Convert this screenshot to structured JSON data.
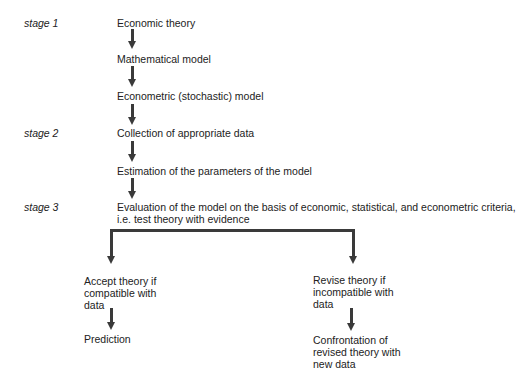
{
  "stages": [
    {
      "label": "stage 1"
    },
    {
      "label": "stage 2"
    },
    {
      "label": "stage 3"
    }
  ],
  "steps": [
    {
      "text": "Economic theory"
    },
    {
      "text": "Mathematical model"
    },
    {
      "text": "Econometric (stochastic) model"
    },
    {
      "text": "Collection of appropriate data"
    },
    {
      "text": "Estimation of the parameters of the model"
    },
    {
      "text": "Evaluation of the model on the basis of economic, statistical, and econometric criteria,",
      "text2": "i.e. test theory with evidence"
    }
  ],
  "branches": {
    "left": {
      "lines": [
        "Accept theory if",
        "compatible with",
        "data"
      ],
      "next": "Prediction"
    },
    "right": {
      "lines": [
        "Revise theory if",
        "incompatible with",
        "data"
      ],
      "next_lines": [
        "Confrontation of",
        "revised theory with",
        "new data"
      ]
    }
  },
  "colors": {
    "line": "#3a3a3a",
    "text": "#222222",
    "background": "#ffffff"
  }
}
